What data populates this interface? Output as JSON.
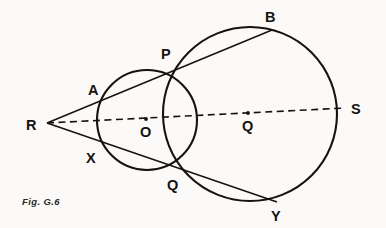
{
  "figure": {
    "caption": "Fig. G.6",
    "caption_x": 22,
    "caption_y": 196,
    "background_color": "#fbfaf8",
    "ink_color": "#16130f",
    "width": 386,
    "height": 228
  },
  "chart_data": {
    "type": "diagram",
    "title": "Fig. G.6",
    "circles": [
      {
        "name": "small-circle",
        "centre_label": "O",
        "cx": 147,
        "cy": 120,
        "r": 50
      },
      {
        "name": "large-circle",
        "centre_label": "Q",
        "cx": 250,
        "cy": 114,
        "r": 87
      }
    ],
    "centres": [
      {
        "label": "O",
        "x": 146,
        "y": 119,
        "label_x": 140,
        "label_y": 137
      },
      {
        "label": "Q",
        "x": 248,
        "y": 113,
        "label_x": 242,
        "label_y": 131
      }
    ],
    "points": [
      {
        "label": "R",
        "x": 47,
        "y": 123,
        "label_x": 26,
        "label_y": 130,
        "role": "external-point"
      },
      {
        "label": "A",
        "x": 108,
        "y": 95,
        "label_x": 88,
        "label_y": 95,
        "role": "small-circle-intersection"
      },
      {
        "label": "P",
        "x": 177,
        "y": 69,
        "label_x": 161,
        "label_y": 59,
        "role": "circle-circle-intersection"
      },
      {
        "label": "B",
        "x": 272,
        "y": 30,
        "label_x": 265,
        "label_y": 22,
        "role": "large-circle-intersection"
      },
      {
        "label": "X",
        "x": 103,
        "y": 147,
        "label_x": 86,
        "label_y": 163,
        "role": "small-circle-intersection"
      },
      {
        "label": "Q",
        "x": 179,
        "y": 169,
        "label_x": 167,
        "label_y": 190,
        "role": "circle-circle-intersection"
      },
      {
        "label": "Y",
        "x": 277,
        "y": 202,
        "label_x": 271,
        "label_y": 221,
        "role": "large-circle-intersection"
      },
      {
        "label": "S",
        "x": 337,
        "y": 108,
        "label_x": 351,
        "label_y": 114,
        "role": "line-of-centres-end"
      }
    ],
    "segments": [
      {
        "name": "secant-upper-R-to-B",
        "x1": 47,
        "y1": 123,
        "x2": 272,
        "y2": 30,
        "style": "solid",
        "through": [
          "R",
          "A",
          "P",
          "B"
        ]
      },
      {
        "name": "secant-lower-R-to-Y",
        "x1": 47,
        "y1": 123,
        "x2": 277,
        "y2": 202,
        "style": "solid",
        "through": [
          "R",
          "X",
          "Q",
          "Y"
        ]
      },
      {
        "name": "line-of-centres-R-to-S",
        "x1": 47,
        "y1": 123,
        "x2": 345,
        "y2": 108,
        "style": "dashed",
        "through": [
          "R",
          "O",
          "Q",
          "S"
        ]
      }
    ]
  }
}
